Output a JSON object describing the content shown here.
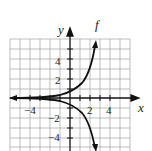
{
  "graph": {
    "function_label": "f",
    "x_axis_label": "x",
    "y_axis_label": "y",
    "x_tick_labels": [
      "−4",
      "2",
      "4"
    ],
    "y_tick_labels": [
      "4",
      "2",
      "−2",
      "−4"
    ],
    "x_range": [
      -6,
      6
    ],
    "y_range": [
      -6,
      6
    ],
    "grid_spacing": 1,
    "curves": [
      {
        "name": "f",
        "description": "increasing exponential through (0,1)",
        "points": [
          [
            -6,
            0.0
          ],
          [
            -4,
            0.05
          ],
          [
            -2,
            0.3
          ],
          [
            0,
            1
          ],
          [
            1,
            2
          ],
          [
            2,
            3.6
          ],
          [
            3,
            5.6
          ]
        ]
      },
      {
        "name": "-f",
        "description": "reflection of f across x-axis",
        "points": [
          [
            -6,
            0.0
          ],
          [
            -4,
            -0.05
          ],
          [
            -2,
            -0.3
          ],
          [
            0,
            -1
          ],
          [
            1,
            -2
          ],
          [
            2,
            -3.6
          ],
          [
            3,
            -5.6
          ]
        ]
      }
    ],
    "colors": {
      "grid": "#9a9a9a",
      "axes": "#111111",
      "curve": "#111111"
    }
  }
}
